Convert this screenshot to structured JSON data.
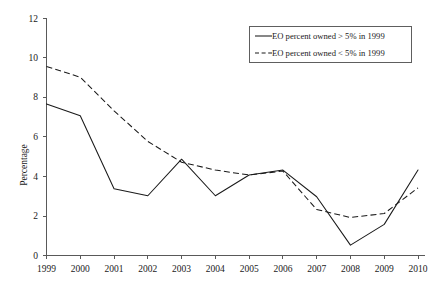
{
  "chart_data": {
    "type": "line",
    "title": "",
    "xlabel": "",
    "ylabel": "Percentage",
    "categories": [
      "1999",
      "2000",
      "2001",
      "2002",
      "2003",
      "2004",
      "2005",
      "2006",
      "2007",
      "2008",
      "2009",
      "2010"
    ],
    "x": [
      1999,
      2000,
      2001,
      2002,
      2003,
      2004,
      2005,
      2006,
      2007,
      2008,
      2009,
      2010
    ],
    "xlim": [
      1999,
      2010
    ],
    "ylim": [
      0,
      12
    ],
    "ytick_labels": [
      "0",
      "2",
      "4",
      "6",
      "8",
      "10",
      "12"
    ],
    "ytick_values": [
      0,
      2,
      4,
      6,
      8,
      10,
      12
    ],
    "xtick_labels": [
      "1999",
      "2000",
      "2001",
      "2002",
      "2003",
      "2004",
      "2005",
      "2006",
      "2007",
      "2008",
      "2009",
      "2010"
    ],
    "grid": false,
    "legend_position": "top-right",
    "series": [
      {
        "name": "EO percent owned > 5% in 1999",
        "style": "solid",
        "color": "#1a1a1a",
        "values": [
          7.65,
          7.05,
          3.35,
          3.0,
          4.85,
          3.0,
          4.05,
          4.3,
          2.95,
          0.5,
          1.55,
          4.3
        ]
      },
      {
        "name": "EO percent owned < 5% in 1999",
        "style": "dashed",
        "color": "#1a1a1a",
        "values": [
          9.55,
          9.0,
          7.3,
          5.75,
          4.7,
          4.3,
          4.05,
          4.25,
          2.3,
          1.9,
          2.1,
          3.4
        ]
      }
    ]
  },
  "legend": {
    "items": [
      {
        "label": "EO percent owned > 5% in 1999",
        "style": "solid"
      },
      {
        "label": "EO percent owned < 5% in 1999",
        "style": "dashed"
      }
    ]
  },
  "axes": {
    "y_title": "Percentage"
  }
}
